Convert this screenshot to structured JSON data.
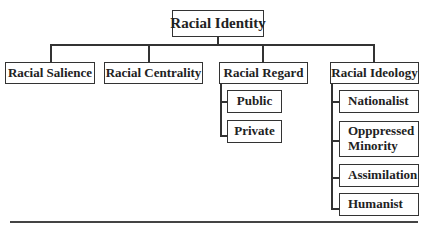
{
  "diagram": {
    "root": {
      "label": "Racial Identity"
    },
    "children": [
      {
        "label": "Racial Salience"
      },
      {
        "label": "Racial Centrality"
      },
      {
        "label": "Racial Regard",
        "sub": [
          {
            "label": "Public"
          },
          {
            "label": "Private"
          }
        ]
      },
      {
        "label": "Racial Ideology",
        "sub": [
          {
            "label": "Nationalist"
          },
          {
            "label": "Opppressed",
            "label2": "Minority"
          },
          {
            "label": "Assimilation"
          },
          {
            "label": "Humanist"
          }
        ]
      }
    ]
  }
}
